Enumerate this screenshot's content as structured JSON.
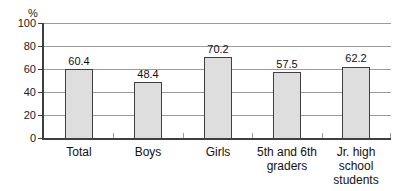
{
  "figure": {
    "background": "#ffffff"
  },
  "chart_data": {
    "type": "bar",
    "title": "",
    "unit_label": "%",
    "categories": [
      "Total",
      "Boys",
      "Girls",
      "5th and 6th graders",
      "Jr. high school students"
    ],
    "category_lines": [
      [
        "Total"
      ],
      [
        "Boys"
      ],
      [
        "Girls"
      ],
      [
        "5th and 6th",
        "graders"
      ],
      [
        "Jr. high",
        "school",
        "students"
      ]
    ],
    "values": [
      60.4,
      48.4,
      70.2,
      57.5,
      62.2
    ],
    "value_labels": [
      "60.4",
      "48.4",
      "70.2",
      "57.5",
      "62.2"
    ],
    "y_ticks": [
      0,
      20,
      40,
      60,
      80,
      100
    ],
    "ylim": [
      0,
      100
    ],
    "grid": true,
    "legend": "none",
    "colors": {
      "bar_fill": "#dedede",
      "bar_border": "#3f3f3f",
      "gridline": "#9b9b9b",
      "axis": "#3f3f3f",
      "text": "#111111"
    }
  }
}
